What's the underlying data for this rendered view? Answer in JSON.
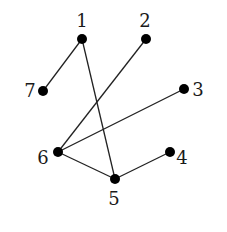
{
  "graph": {
    "nodes": [
      {
        "id": "1",
        "label": "1",
        "x": 82,
        "y": 39,
        "lx": 82,
        "ly": 27,
        "anchor": "middle"
      },
      {
        "id": "2",
        "label": "2",
        "x": 146,
        "y": 39,
        "lx": 145,
        "ly": 27,
        "anchor": "middle"
      },
      {
        "id": "3",
        "label": "3",
        "x": 184,
        "y": 89,
        "lx": 198,
        "ly": 96,
        "anchor": "middle"
      },
      {
        "id": "4",
        "label": "4",
        "x": 170,
        "y": 152,
        "lx": 182,
        "ly": 164,
        "anchor": "middle"
      },
      {
        "id": "5",
        "label": "5",
        "x": 115,
        "y": 179,
        "lx": 114,
        "ly": 205,
        "anchor": "middle"
      },
      {
        "id": "6",
        "label": "6",
        "x": 58,
        "y": 152,
        "lx": 43,
        "ly": 164,
        "anchor": "middle"
      },
      {
        "id": "7",
        "label": "7",
        "x": 43,
        "y": 91,
        "lx": 30,
        "ly": 97,
        "anchor": "middle"
      }
    ],
    "edges": [
      {
        "from": "1",
        "to": "7"
      },
      {
        "from": "1",
        "to": "5"
      },
      {
        "from": "2",
        "to": "6"
      },
      {
        "from": "3",
        "to": "6"
      },
      {
        "from": "6",
        "to": "5"
      },
      {
        "from": "5",
        "to": "4"
      }
    ],
    "node_color": "#000000",
    "edge_color": "#222222"
  }
}
